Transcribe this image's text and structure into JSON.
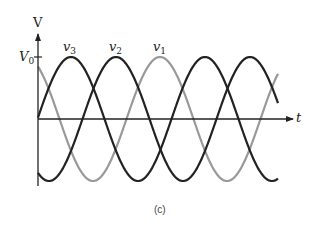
{
  "figure": {
    "caption": "(c)",
    "y_axis_label": "V",
    "x_axis_label": "t",
    "amplitude_label": "V",
    "amplitude_subscript": "0"
  },
  "chart_data": {
    "type": "line",
    "title": "",
    "xlabel": "t",
    "ylabel": "V",
    "y_tick_labels": [
      "V0"
    ],
    "amplitude": 1,
    "period": 1,
    "x_range": [
      0,
      1.79
    ],
    "ylim": [
      -1,
      1
    ],
    "series": [
      {
        "name": "v3",
        "label": "v",
        "subscript": "3",
        "color": "#222222",
        "peak_x": 0.246,
        "phase_deg": -66
      },
      {
        "name": "v2",
        "label": "v",
        "subscript": "2",
        "color": "#222222",
        "peak_x": 0.582,
        "phase_deg": -210
      },
      {
        "name": "v1",
        "label": "v",
        "subscript": "1",
        "color": "#999999",
        "peak_x": 0.91,
        "phase_deg": -328
      }
    ],
    "grid": false,
    "legend": "inline labels above peaks"
  },
  "layout_px": {
    "origin_x": 38,
    "baseline_y": 119,
    "amplitude": 62,
    "period": 134,
    "x_end": 278,
    "peaks": {
      "v3": 71,
      "v2": 116,
      "v1": 160
    }
  }
}
